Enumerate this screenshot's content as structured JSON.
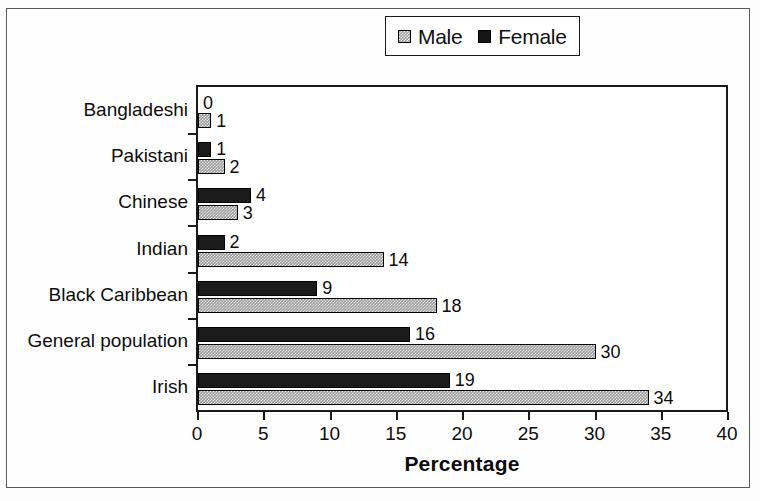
{
  "chart_data": {
    "type": "bar",
    "orientation": "horizontal",
    "title": "",
    "xlabel": "Percentage",
    "ylabel": "",
    "xlim": [
      0,
      40
    ],
    "xticks": [
      0,
      5,
      10,
      15,
      20,
      25,
      30,
      35,
      40
    ],
    "grid": false,
    "legend_position": "top-center",
    "categories": [
      "Bangladeshi",
      "Pakistani",
      "Chinese",
      "Indian",
      "Black Caribbean",
      "General population",
      "Irish"
    ],
    "series": [
      {
        "name": "Female",
        "swatch": "solid-black",
        "color": "#1b1b1b",
        "values": [
          0,
          1,
          4,
          2,
          9,
          16,
          19
        ]
      },
      {
        "name": "Male",
        "swatch": "gray-stipple",
        "color": "#9a9a9a",
        "values": [
          1,
          2,
          3,
          14,
          18,
          30,
          34
        ]
      }
    ],
    "data_labels": {
      "Bangladeshi": {
        "Female": "0",
        "Male": "1"
      },
      "Pakistani": {
        "Female": "1",
        "Male": "2"
      },
      "Chinese": {
        "Female": "4",
        "Male": "3"
      },
      "Indian": {
        "Female": "2",
        "Male": "14"
      },
      "Black Caribbean": {
        "Female": "9",
        "Male": "18"
      },
      "General population": {
        "Female": "16",
        "Male": "30"
      },
      "Irish": {
        "Female": "19",
        "Male": "34"
      }
    }
  },
  "legend": {
    "entries": [
      {
        "label": "Male"
      },
      {
        "label": "Female"
      }
    ]
  },
  "axis": {
    "x_title": "Percentage",
    "tick_labels": [
      "0",
      "5",
      "10",
      "15",
      "20",
      "25",
      "30",
      "35",
      "40"
    ]
  },
  "colors": {
    "female_bar": "#1b1b1b",
    "male_bar": "#9a9a9a",
    "axis": "#1a1a1a",
    "text": "#0d0d0d",
    "background": "#ffffff"
  }
}
